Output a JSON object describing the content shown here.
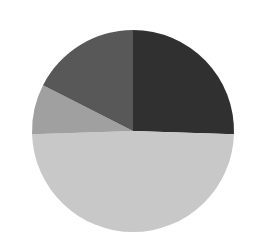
{
  "chart_data": {
    "type": "pie",
    "title": "",
    "subtitle": "",
    "xlabel": "",
    "ylabel": "",
    "grid": false,
    "legend": "none",
    "labels_visible": false,
    "start_angle_deg": 0,
    "direction": "clockwise",
    "center": {
      "x": 133,
      "y": 131
    },
    "radius": 101,
    "background": "#ffffff",
    "categories": [
      "Slice 1",
      "Slice 2",
      "Slice 3",
      "Slice 4"
    ],
    "values": [
      25.5,
      49.0,
      8.0,
      17.5
    ],
    "unit": "%",
    "colors": [
      "#303030",
      "#c8c8c8",
      "#a0a0a0",
      "#585858"
    ],
    "slices": [
      {
        "name": "Slice 1",
        "value": 25.5,
        "color": "#303030",
        "start_deg": 0,
        "end_deg": 91.8
      },
      {
        "name": "Slice 2",
        "value": 49.0,
        "color": "#c8c8c8",
        "start_deg": 91.8,
        "end_deg": 268.2
      },
      {
        "name": "Slice 3",
        "value": 8.0,
        "color": "#a0a0a0",
        "start_deg": 268.2,
        "end_deg": 297.0
      },
      {
        "name": "Slice 4",
        "value": 17.5,
        "color": "#585858",
        "start_deg": 297.0,
        "end_deg": 360.0
      }
    ]
  }
}
